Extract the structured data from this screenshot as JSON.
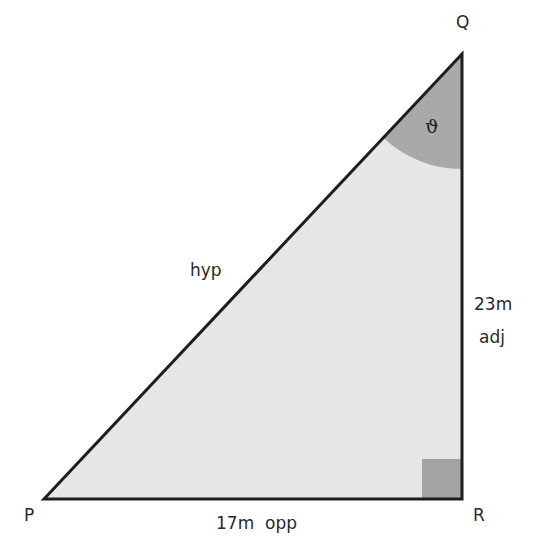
{
  "diagram": {
    "type": "right-triangle",
    "vertices": {
      "P": {
        "label": "P"
      },
      "Q": {
        "label": "Q"
      },
      "R": {
        "label": "R"
      }
    },
    "angle_label": "ϑ",
    "sides": {
      "hyp": {
        "label": "hyp"
      },
      "adj": {
        "length": "23m",
        "label": "adj"
      },
      "opp": {
        "length": "17m",
        "label": "opp",
        "combined": "17m  opp"
      }
    },
    "colors": {
      "fill": "#e6e6e6",
      "angle_fill": "#a9a9a9",
      "right_angle_fill": "#a3a3a3",
      "stroke": "#1e1e1e",
      "text": "#2a2a2a"
    }
  }
}
